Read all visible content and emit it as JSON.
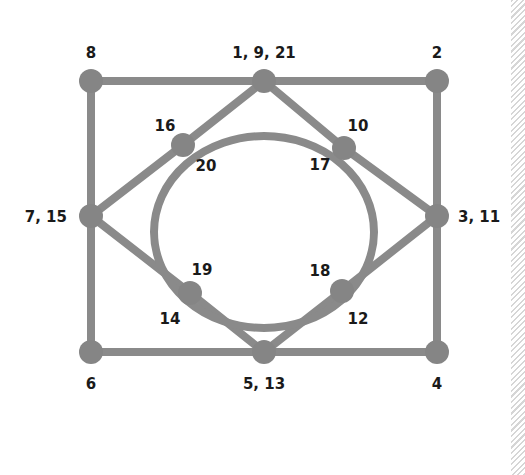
{
  "diagram": {
    "type": "graph",
    "stroke_color": "#8a8a8a",
    "node_color": "#858585",
    "label_color": "#1a1a1a",
    "nodes": [
      {
        "id": "top-center",
        "x": 264,
        "y": 81,
        "label": "1, 9, 21",
        "lx": 264,
        "ly": 58,
        "anchor": "middle"
      },
      {
        "id": "top-right",
        "x": 437,
        "y": 81,
        "label": "2",
        "lx": 437,
        "ly": 58,
        "anchor": "middle"
      },
      {
        "id": "right-middle",
        "x": 437,
        "y": 216,
        "label": "3, 11",
        "lx": 458,
        "ly": 222,
        "anchor": "start"
      },
      {
        "id": "bottom-right",
        "x": 437,
        "y": 352,
        "label": "4",
        "lx": 437,
        "ly": 389,
        "anchor": "middle"
      },
      {
        "id": "bottom-center",
        "x": 264,
        "y": 352,
        "label": "5, 13",
        "lx": 264,
        "ly": 389,
        "anchor": "middle"
      },
      {
        "id": "bottom-left",
        "x": 91,
        "y": 352,
        "label": "6",
        "lx": 91,
        "ly": 389,
        "anchor": "middle"
      },
      {
        "id": "left-middle",
        "x": 91,
        "y": 216,
        "label": "7, 15",
        "lx": 67,
        "ly": 222,
        "anchor": "end"
      },
      {
        "id": "top-left",
        "x": 91,
        "y": 81,
        "label": "8",
        "lx": 91,
        "ly": 58,
        "anchor": "middle"
      },
      {
        "id": "upper-right-inner",
        "x": 344,
        "y": 148,
        "label": "10",
        "lx": 358,
        "ly": 131,
        "anchor": "middle"
      },
      {
        "id": "lower-right-inner",
        "x": 342,
        "y": 291,
        "label": "12",
        "lx": 358,
        "ly": 324,
        "anchor": "middle"
      },
      {
        "id": "lower-left-inner",
        "x": 190,
        "y": 293,
        "label": "14",
        "lx": 170,
        "ly": 324,
        "anchor": "middle"
      },
      {
        "id": "upper-left-inner",
        "x": 183,
        "y": 145,
        "label": "16",
        "lx": 165,
        "ly": 131,
        "anchor": "middle"
      }
    ],
    "inner_labels": [
      {
        "label": "17",
        "x": 320,
        "y": 170,
        "anchor": "middle"
      },
      {
        "label": "18",
        "x": 320,
        "y": 276,
        "anchor": "middle"
      },
      {
        "label": "19",
        "x": 202,
        "y": 275,
        "anchor": "middle"
      },
      {
        "label": "20",
        "x": 206,
        "y": 171,
        "anchor": "middle"
      }
    ],
    "square_edges": [
      [
        "top-left",
        "top-center"
      ],
      [
        "top-center",
        "top-right"
      ],
      [
        "top-right",
        "right-middle"
      ],
      [
        "right-middle",
        "bottom-right"
      ],
      [
        "bottom-right",
        "bottom-center"
      ],
      [
        "bottom-center",
        "bottom-left"
      ],
      [
        "bottom-left",
        "left-middle"
      ],
      [
        "left-middle",
        "top-left"
      ]
    ],
    "diamond_edges": [
      [
        "top-center",
        "upper-right-inner"
      ],
      [
        "upper-right-inner",
        "right-middle"
      ],
      [
        "right-middle",
        "lower-right-inner"
      ],
      [
        "lower-right-inner",
        "bottom-center"
      ],
      [
        "bottom-center",
        "lower-left-inner"
      ],
      [
        "lower-left-inner",
        "left-middle"
      ],
      [
        "left-middle",
        "upper-left-inner"
      ],
      [
        "upper-left-inner",
        "top-center"
      ]
    ],
    "ellipse": {
      "cx": 264,
      "cy": 232,
      "rx": 110,
      "ry": 96
    }
  }
}
